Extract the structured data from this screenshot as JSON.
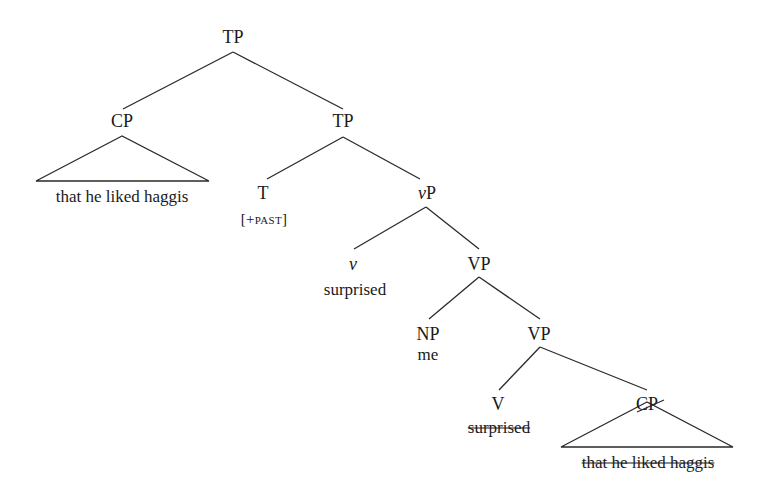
{
  "diagram": {
    "type": "syntax-tree",
    "nodes": {
      "tp_root": {
        "label": "TP"
      },
      "cp_subject": {
        "label": "CP",
        "terminal": "that he liked haggis"
      },
      "tp_bar": {
        "label": "TP"
      },
      "t_head": {
        "label": "T",
        "feature_open": "[+",
        "feature": "past",
        "feature_close": "]"
      },
      "vp_little": {
        "label_italic": "v",
        "label_rest": "P"
      },
      "v_head": {
        "label": "v",
        "terminal": "surprised"
      },
      "vp_upper": {
        "label": "VP"
      },
      "np_object": {
        "label": "NP",
        "terminal": "me"
      },
      "vp_lower": {
        "label": "VP"
      },
      "v_lower": {
        "label": "V",
        "terminal_struck": "surprised"
      },
      "cp_trace": {
        "label_struck": "CP",
        "terminal_struck": "that he liked haggis"
      }
    },
    "edges": [
      [
        "TP",
        "CP"
      ],
      [
        "TP",
        "TP"
      ],
      [
        "TP",
        "T"
      ],
      [
        "TP",
        "vP"
      ],
      [
        "vP",
        "v"
      ],
      [
        "vP",
        "VP"
      ],
      [
        "VP",
        "NP"
      ],
      [
        "VP",
        "VP"
      ],
      [
        "VP",
        "V"
      ],
      [
        "VP",
        "CP"
      ]
    ]
  }
}
